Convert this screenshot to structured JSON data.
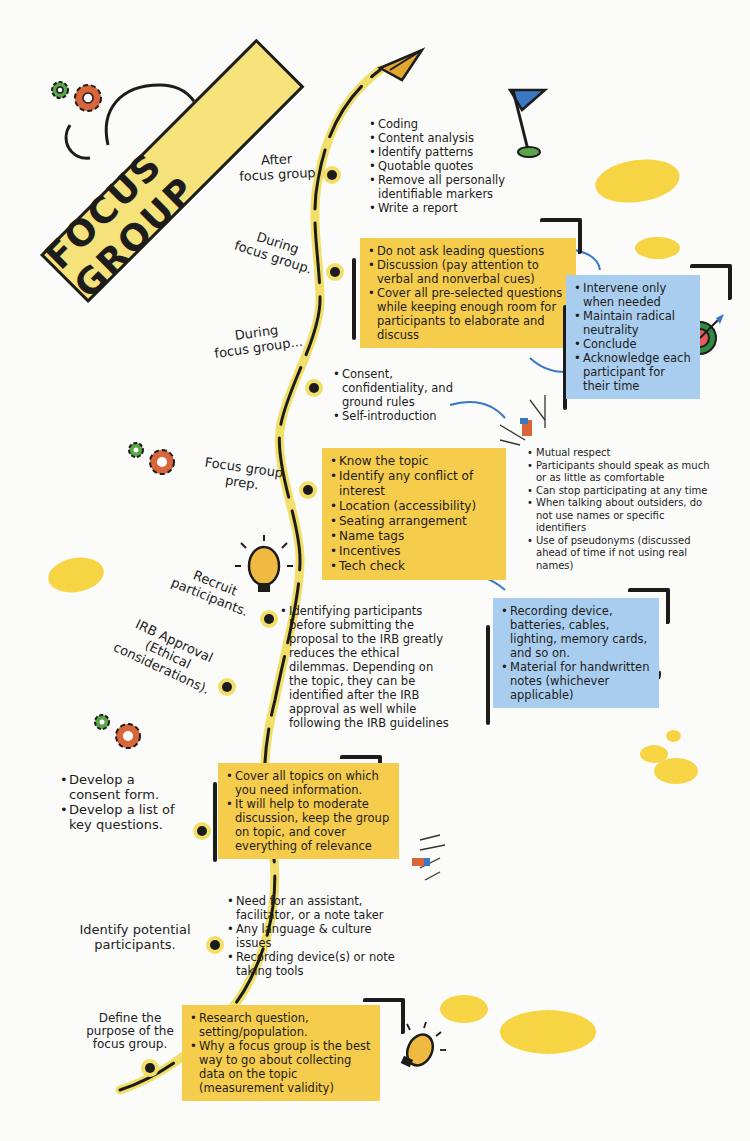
{
  "title": "FOCUS GROUP",
  "colors": {
    "yellow_box": "#f6cc4c",
    "blue_box": "#a9cdee",
    "path_yellow": "#f2df6a",
    "ink": "#1c1c1c",
    "gear_orange": "#d9653b",
    "gear_green": "#5aa54a",
    "flag_blue": "#3b78c4"
  },
  "stages": [
    {
      "id": "after",
      "label": "After\nfocus group",
      "items": [
        "Coding",
        "Content analysis",
        "Identify patterns",
        "Quotable quotes",
        "Remove all personally identifiable markers",
        "Write a report"
      ]
    },
    {
      "id": "during1",
      "label": "During\nfocus group.",
      "box": [
        "Do not ask leading questions",
        "Discussion (pay attention to verbal and nonverbal cues)",
        "Cover all pre-selected questions while keeping enough room for participants to elaborate and discuss"
      ],
      "moderator_box": [
        "Intervene only when needed",
        "Maintain radical neutrality",
        "Conclude",
        "Acknowledge each participant for their time"
      ]
    },
    {
      "id": "during2",
      "label": "During\nfocus group...",
      "items": [
        "Consent, confidentiality, and ground rules",
        "Self-introduction"
      ],
      "ground_rules": [
        "Mutual respect",
        "Participants should speak as much or as little as comfortable",
        "Can stop participating at any time",
        "When talking about outsiders, do not use names or specific identifiers",
        "Use of pseudonyms (discussed ahead of time if not using real names)"
      ]
    },
    {
      "id": "prep",
      "label": "Focus group\nprep.",
      "box": [
        "Know the topic",
        "Identify any conflict of interest",
        "Location (accessibility)",
        "Seating arrangement",
        "Name tags",
        "Incentives",
        "Tech check"
      ],
      "tech_box": [
        "Recording device, batteries, cables, lighting, memory cards, and so on.",
        "Material for handwritten notes (whichever applicable)"
      ]
    },
    {
      "id": "recruit",
      "label": "Recruit\nparticipants.",
      "items": [
        "Identifying participants before submitting the proposal to the IRB greatly reduces the ethical dilemmas. Depending on the topic, they can be identified after the IRB approval as well while following the IRB guidelines"
      ]
    },
    {
      "id": "irb",
      "label": "IRB Approval\n(Ethical\nconsiderations)."
    },
    {
      "id": "develop",
      "label_items": [
        "Develop a consent form.",
        "Develop a list of key questions."
      ],
      "box": [
        "Cover all topics on which you need information.",
        "It will help to moderate discussion, keep the group on topic, and cover everything of relevance"
      ]
    },
    {
      "id": "identify",
      "label": "Identify potential\nparticipants.",
      "items": [
        "Need for an assistant, facilitator, or a note taker",
        "Any language & culture issues",
        "Recording device(s) or note taking tools"
      ]
    },
    {
      "id": "define",
      "label": "Define the\npurpose of the\nfocus group.",
      "box": [
        "Research question, setting/population.",
        "Why a focus group is the best way to go about collecting data on the topic (measurement validity)"
      ]
    }
  ]
}
